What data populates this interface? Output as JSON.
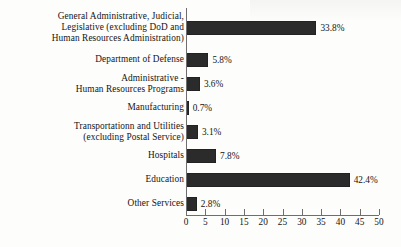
{
  "chart_data": {
    "type": "bar",
    "orientation": "horizontal",
    "title": "",
    "subtitle": "",
    "xlabel": "",
    "ylabel": "",
    "xlim": [
      0,
      50
    ],
    "xticks": [
      0,
      5,
      10,
      15,
      20,
      25,
      30,
      35,
      40,
      45,
      50
    ],
    "xtick_labels": [
      "0",
      "5",
      "10",
      "15",
      "20",
      "25",
      "30",
      "35",
      "40",
      "45",
      "50"
    ],
    "grid": false,
    "legend": null,
    "bar_color": "#2b2b2b",
    "axis_color": "#6e6e6e",
    "value_suffix": "%",
    "categories": [
      "General Administrative, Judicial,\nLegislative (excluding DoD and\nHuman Resources Administration)",
      "Department of Defense",
      "Administrative -\nHuman Resources Programs",
      "Manufacturing",
      "Transportationn and Utilities\n(excluding Postal Service)",
      "Hospitals",
      "Education",
      "Other Services"
    ],
    "values": [
      33.8,
      5.8,
      3.6,
      0.7,
      3.1,
      7.8,
      42.4,
      2.8
    ],
    "value_labels": [
      "33.8%",
      "5.8%",
      "3.6%",
      "0.7%",
      "3.1%",
      "7.8%",
      "42.4%",
      "2.8%"
    ],
    "bars": [
      {
        "label": "General Administrative, Judicial,\nLegislative (excluding DoD and\nHuman Resources Administration)",
        "value": 33.8,
        "value_label": "33.8%",
        "tall": true
      },
      {
        "label": "Department of Defense",
        "value": 5.8,
        "value_label": "5.8%",
        "tall": false
      },
      {
        "label": "Administrative -\nHuman Resources Programs",
        "value": 3.6,
        "value_label": "3.6%",
        "tall": false
      },
      {
        "label": "Manufacturing",
        "value": 0.7,
        "value_label": "0.7%",
        "tall": false
      },
      {
        "label": "Transportationn and Utilities\n(excluding Postal Service)",
        "value": 3.1,
        "value_label": "3.1%",
        "tall": false
      },
      {
        "label": "Hospitals",
        "value": 7.8,
        "value_label": "7.8%",
        "tall": false
      },
      {
        "label": "Education",
        "value": 42.4,
        "value_label": "42.4%",
        "tall": false
      },
      {
        "label": "Other Services",
        "value": 2.8,
        "value_label": "2.8%",
        "tall": false
      }
    ]
  }
}
